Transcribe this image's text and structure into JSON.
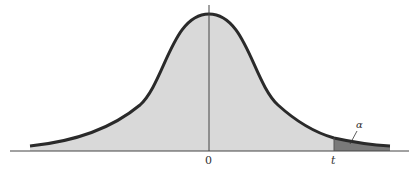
{
  "figure": {
    "labels": {
      "zero": "0",
      "t": "t",
      "alpha": "α"
    },
    "colors": {
      "curve": "#2a2a2a",
      "body_fill": "#d9d9d9",
      "tail_fill": "#7a7a7a",
      "axis": "#444444"
    }
  }
}
